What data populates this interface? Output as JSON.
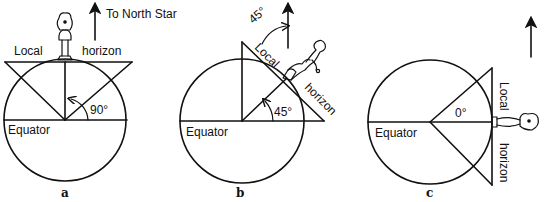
{
  "figure": {
    "ink_color": "#111111",
    "background": "#ffffff",
    "north_star_label": "To North Star",
    "panels": [
      {
        "id": "a",
        "caption": "a",
        "angle_label": "90°",
        "equator_label": "Equator",
        "horizon_word_1": "Local",
        "horizon_word_2": "horizon",
        "observer": "person standing at north pole"
      },
      {
        "id": "b",
        "caption": "b",
        "angle_label": "45°",
        "star_angle_label": "45°",
        "equator_label": "Equator",
        "horizon_word_1": "Local",
        "horizon_word_2": "horizon",
        "observer": "person leaning at 45° latitude"
      },
      {
        "id": "c",
        "caption": "c",
        "angle_label": "0°",
        "equator_label": "Equator",
        "horizon_word_1": "Local",
        "horizon_word_2": "horizon",
        "observer": "person lying horizontal at equator"
      }
    ]
  }
}
